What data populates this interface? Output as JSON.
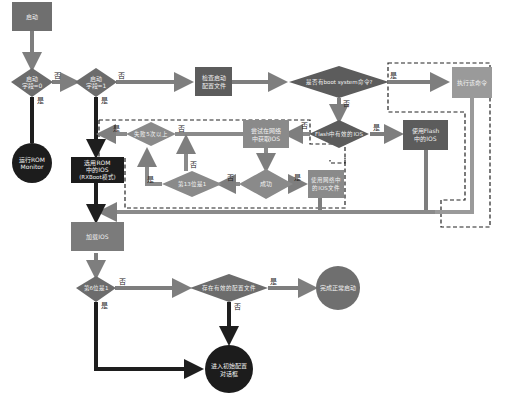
{
  "diagram": {
    "title": "",
    "colors": {
      "medium_gray": "#7b7b7b",
      "dark_gray": "#5c5c5c",
      "light_gray": "#9a9a9a",
      "black": "#1c1c1c",
      "arrow_gray": "#8a8a8a",
      "arrow_dark": "#2a2a2a"
    },
    "nodes": {
      "start": "启动",
      "reg0": [
        "启动",
        "字段=0"
      ],
      "reg1": [
        "启动",
        "字段=1"
      ],
      "rom_monitor": [
        "运行ROM",
        "Monitor"
      ],
      "check_config": [
        "检查启动",
        "配置文件"
      ],
      "boot_system": "是否有boot system命令?",
      "exec_cmd": "执行该命令",
      "flash_ios": "Flash中有效的IOS",
      "use_flash": [
        "使用Flash",
        "中的IOS"
      ],
      "try_net": [
        "尝试在网络",
        "中获取IOS"
      ],
      "fail5": "失败5次以上",
      "reg_bit13": "第13位是1",
      "success": "成功",
      "use_net": [
        "使用网络中",
        "的IOS文件"
      ],
      "rom_ios": [
        "选用ROM",
        "中的IOS",
        "(RXBoot模式)"
      ],
      "load_ios": "加载IOS",
      "bit6": "第6位是1",
      "valid_config": "存在有效的配置文件",
      "done": "完成正常启动",
      "setup": [
        "进入初始配置",
        "对话框"
      ]
    },
    "edge_labels": {
      "reg0_no": "否",
      "reg0_yes": "是",
      "reg1_no": "否",
      "reg1_yes": "是",
      "boot_no": "否",
      "boot_yes": "是",
      "flash_no": "否",
      "flash_yes": "是",
      "try_no": "否",
      "fail_yes": "是",
      "fail_no": "否",
      "bit13_yes": "是",
      "bit13_no": "否",
      "success_no": "否",
      "success_yes": "是",
      "bit6_no": "否",
      "bit6_yes": "是",
      "valid_yes": "是",
      "valid_no": "否"
    }
  }
}
